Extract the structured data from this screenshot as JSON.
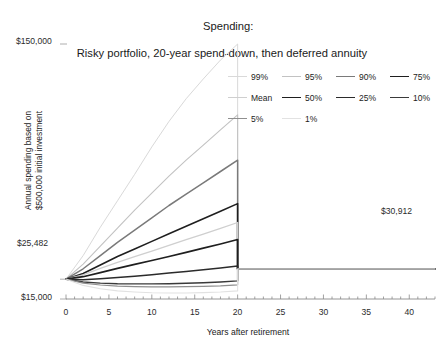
{
  "chart_data": {
    "type": "line",
    "title": "Spending:",
    "subtitle": "Risky portfolio, 20-year spend-down, then deferred annuity",
    "xlabel": "Years after retirement",
    "ylabel_line1": "Annual spending based on",
    "ylabel_line2": "$500,000 initial investment",
    "xlim": [
      0,
      43
    ],
    "ylim": [
      15000,
      150000
    ],
    "xticks": [
      0,
      5,
      10,
      15,
      20,
      25,
      30,
      35,
      40
    ],
    "xtick_labels": [
      "0",
      "5",
      "10",
      "15",
      "20",
      "25",
      "30",
      "35",
      "40"
    ],
    "yticks": [
      15000,
      25482,
      150000
    ],
    "ytick_labels": [
      "$15,000",
      "$25,482",
      "$150,000"
    ],
    "grid": false,
    "legend_position": "upper-right-inside",
    "annotations": [
      {
        "text": "$30,912",
        "x": 37.5,
        "y": 30912,
        "note": "deferred annuity level payout after year 20"
      }
    ],
    "start_value": 25482,
    "annuity_value": 30912,
    "spenddown_end_year": 20,
    "x": [
      0,
      2,
      4,
      6,
      8,
      10,
      12,
      14,
      16,
      18,
      20,
      20.001,
      43
    ],
    "series": [
      {
        "name": "99%",
        "color": "#d9d9d9",
        "width": 1.0,
        "values": [
          25482,
          38000,
          53000,
          67000,
          81000,
          95500,
          109000,
          121000,
          131500,
          141500,
          150000,
          30912,
          30912
        ]
      },
      {
        "name": "95%",
        "color": "#c2c2c2",
        "width": 1.1,
        "values": [
          25482,
          33500,
          43000,
          52500,
          62000,
          71000,
          80000,
          88500,
          96500,
          104500,
          112500,
          30912,
          30912
        ]
      },
      {
        "name": "90%",
        "color": "#7a7a7a",
        "width": 1.5,
        "values": [
          25482,
          31000,
          38000,
          45000,
          51500,
          58000,
          64500,
          70500,
          76500,
          82500,
          88500,
          30912,
          30912
        ]
      },
      {
        "name": "75%",
        "color": "#1f1f1f",
        "width": 1.6,
        "values": [
          25482,
          28500,
          33000,
          37500,
          41500,
          45500,
          49500,
          53500,
          57500,
          61500,
          65500,
          30912,
          30912
        ]
      },
      {
        "name": "Mean",
        "color": "#cfcfcf",
        "width": 1.3,
        "values": [
          25482,
          27800,
          31200,
          34400,
          37400,
          40400,
          43400,
          46400,
          49400,
          52400,
          55500,
          30912,
          30912
        ]
      },
      {
        "name": "50%",
        "color": "#1f1f1f",
        "width": 1.7,
        "values": [
          25482,
          26800,
          29000,
          31200,
          33300,
          35400,
          37500,
          39700,
          41900,
          44100,
          46500,
          30912,
          30912
        ]
      },
      {
        "name": "25%",
        "color": "#2b2b2b",
        "width": 1.5,
        "values": [
          25482,
          25200,
          25700,
          26400,
          27100,
          27900,
          28700,
          29600,
          30500,
          31400,
          32500,
          30912,
          30912
        ]
      },
      {
        "name": "10%",
        "color": "#3a3a3a",
        "width": 1.4,
        "values": [
          25482,
          24000,
          23400,
          23100,
          23000,
          23000,
          23100,
          23300,
          23600,
          24000,
          24600,
          30912,
          30912
        ]
      },
      {
        "name": "5%",
        "color": "#8f8f8f",
        "width": 1.2,
        "values": [
          25482,
          23400,
          22400,
          21800,
          21500,
          21400,
          21400,
          21500,
          21700,
          22000,
          22500,
          30912,
          30912
        ]
      },
      {
        "name": "1%",
        "color": "#e2e2e2",
        "width": 1.1,
        "values": [
          25482,
          22200,
          20400,
          19300,
          18700,
          18300,
          18200,
          18200,
          18400,
          18700,
          19300,
          30912,
          30912
        ]
      }
    ]
  },
  "legend": {
    "rows": [
      [
        {
          "label": "99%",
          "color": "#d9d9d9",
          "width": 1.0
        },
        {
          "label": "95%",
          "color": "#c2c2c2",
          "width": 1.1
        },
        {
          "label": "90%",
          "color": "#7a7a7a",
          "width": 1.6
        },
        {
          "label": "75%",
          "color": "#1f1f1f",
          "width": 1.8
        }
      ],
      [
        {
          "label": "Mean",
          "color": "#cfcfcf",
          "width": 1.3
        },
        {
          "label": "50%",
          "color": "#1f1f1f",
          "width": 1.8
        },
        {
          "label": "25%",
          "color": "#2b2b2b",
          "width": 1.6
        },
        {
          "label": "10%",
          "color": "#3a3a3a",
          "width": 1.5
        }
      ],
      [
        {
          "label": "5%",
          "color": "#8f8f8f",
          "width": 1.2
        },
        {
          "label": "1%",
          "color": "#e2e2e2",
          "width": 1.1
        }
      ]
    ]
  }
}
